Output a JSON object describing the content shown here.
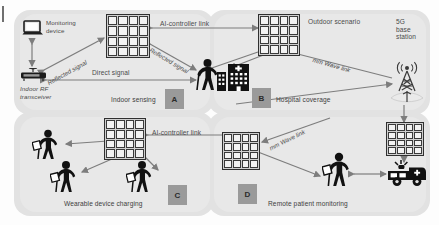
{
  "figure": {
    "accent_gray": "#9a9a9a",
    "panel_gray": "#e2e2e2",
    "arrow_gray": "#7d7d7d"
  },
  "quadrants": [
    {
      "id": "A",
      "badge": "A",
      "caption": "Indoor sensing"
    },
    {
      "id": "B",
      "badge": "B",
      "caption": "Hospital coverage"
    },
    {
      "id": "C",
      "badge": "C",
      "caption": "Wearable device charging"
    },
    {
      "id": "D",
      "badge": "D",
      "caption": "Remote patient monitoring"
    }
  ],
  "labels": {
    "monitoring_device": "Monitoring\ndevice",
    "indoor_rf_transceiver": "Indoor RF\ntransceiver",
    "reflected_signal_left": "Reflected signal",
    "reflected_signal_right": "Reflected signal",
    "direct_signal": "Direct signal",
    "ai_controller_link_top": "AI-controller link",
    "ai_controller_link_bottom": "AI-controller link",
    "outdoor_scenario": "Outdoor scenario",
    "mmwave_link_top": "mm Wave link",
    "mmwave_link_bottom": "mm Wave link",
    "base_station": "5G\nbase\nstation"
  },
  "icons": {
    "laptop": "laptop-icon",
    "router": "router-icon",
    "ris_panel": "ris-panel-icon",
    "person_cane": "person-with-cane-icon",
    "hospital": "hospital-building-icon",
    "tower": "cell-tower-icon",
    "ambulance": "ambulance-icon",
    "wearable": "wearable-device-icon"
  }
}
